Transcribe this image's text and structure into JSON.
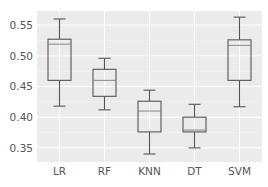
{
  "chart_data": {
    "type": "box",
    "title": "",
    "xlabel": "",
    "ylabel": "",
    "categories": [
      "LR",
      "RF",
      "KNN",
      "DT",
      "SVM"
    ],
    "yticks": [
      0.35,
      0.4,
      0.45,
      0.5,
      0.55
    ],
    "ytick_labels": [
      "0.35",
      "0.40",
      "0.45",
      "0.50",
      "0.55"
    ],
    "ylim": [
      0.327,
      0.573
    ],
    "grid": true,
    "legend": null,
    "series": [
      {
        "name": "LR",
        "whisker_low": 0.418,
        "q1": 0.46,
        "median": 0.519,
        "q3": 0.527,
        "whisker_high": 0.56
      },
      {
        "name": "RF",
        "whisker_low": 0.412,
        "q1": 0.434,
        "median": 0.46,
        "q3": 0.478,
        "whisker_high": 0.496
      },
      {
        "name": "KNN",
        "whisker_low": 0.34,
        "q1": 0.376,
        "median": 0.41,
        "q3": 0.426,
        "whisker_high": 0.444
      },
      {
        "name": "DT",
        "whisker_low": 0.35,
        "q1": 0.376,
        "median": 0.379,
        "q3": 0.4,
        "whisker_high": 0.421
      },
      {
        "name": "SVM",
        "whisker_low": 0.417,
        "q1": 0.46,
        "median": 0.517,
        "q3": 0.526,
        "whisker_high": 0.563
      }
    ],
    "colors": {
      "panel_background": "#ebebeb",
      "grid": "#ffffff",
      "box_stroke": "#555555",
      "tick_text": "#555555"
    }
  }
}
